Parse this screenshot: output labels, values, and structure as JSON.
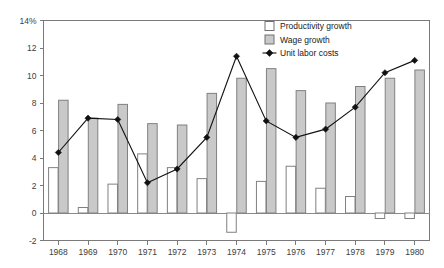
{
  "chart_data": {
    "type": "bar",
    "title": "",
    "subtitle": "",
    "xlabel": "",
    "ylabel": "",
    "categories": [
      "1968",
      "1969",
      "1970",
      "1971",
      "1972",
      "1973",
      "1974",
      "1975",
      "1976",
      "1977",
      "1978",
      "1979",
      "1980"
    ],
    "ylim": [
      -2,
      14
    ],
    "yticks": [
      "14%",
      "12",
      "10",
      "8",
      "6",
      "4",
      "2",
      "0",
      "-2"
    ],
    "ytick_values": [
      14,
      12,
      10,
      8,
      6,
      4,
      2,
      0,
      -2
    ],
    "grid": false,
    "legend_position": "top-right",
    "series": [
      {
        "name": "Productivity growth",
        "type": "bar",
        "color": "#ffffff",
        "values": [
          3.3,
          0.4,
          2.1,
          4.3,
          3.3,
          2.5,
          -1.4,
          2.3,
          3.4,
          1.8,
          1.2,
          -0.4,
          -0.4
        ]
      },
      {
        "name": "Wage growth",
        "type": "bar",
        "color": "#c9c9c9",
        "values": [
          8.2,
          6.9,
          7.9,
          6.5,
          6.4,
          8.7,
          9.8,
          10.5,
          8.9,
          8.0,
          9.2,
          9.8,
          10.4
        ]
      },
      {
        "name": "Unit labor costs",
        "type": "line",
        "color": "#111111",
        "marker": "diamond",
        "values": [
          4.4,
          6.9,
          6.8,
          2.2,
          3.2,
          5.5,
          11.4,
          6.7,
          5.5,
          6.1,
          7.7,
          10.2,
          11.1
        ]
      }
    ]
  },
  "legend": {
    "items": [
      {
        "label": "Productivity growth",
        "icon": "square-outline-swatch"
      },
      {
        "label": "Wage growth",
        "icon": "square-filled-swatch"
      },
      {
        "label": "Unit labor costs",
        "icon": "diamond-marker"
      }
    ]
  }
}
